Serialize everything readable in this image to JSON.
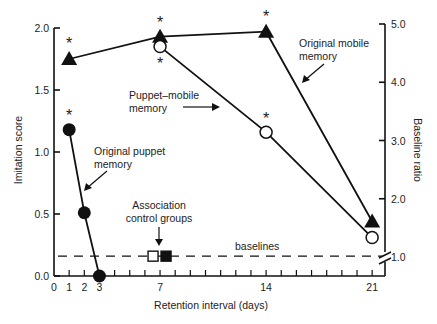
{
  "chart_data": {
    "type": "line",
    "title": "",
    "xlabel": "Retention interval (days)",
    "ylabel": "Imitation score",
    "y2label": "Baseline ratio",
    "xlim": [
      0,
      21
    ],
    "ylim": [
      0,
      2.0
    ],
    "y2lim": [
      1.0,
      5.0
    ],
    "x_ticks": [
      0,
      1,
      2,
      3,
      7,
      14,
      21
    ],
    "y_ticks": [
      "0.0",
      "0.5",
      "1.0",
      "1.5",
      "2.0"
    ],
    "y2_ticks": [
      "1.0",
      "2.0",
      "3.0",
      "4.0",
      "5.0"
    ],
    "grid": false,
    "series": [
      {
        "name": "Original mobile memory",
        "marker": "filled-triangle",
        "x": [
          1,
          7,
          14,
          21
        ],
        "values": [
          1.75,
          1.93,
          1.97,
          0.44
        ],
        "significant": [
          true,
          true,
          true,
          false
        ]
      },
      {
        "name": "Puppet–mobile memory",
        "marker": "open-circle",
        "x": [
          7,
          14,
          21
        ],
        "values": [
          1.85,
          1.16,
          0.31
        ],
        "significant": [
          true,
          true,
          false
        ]
      },
      {
        "name": "Original puppet memory",
        "marker": "filled-circle",
        "x": [
          1,
          2,
          3
        ],
        "values": [
          1.18,
          0.51,
          0.0
        ],
        "significant": [
          true,
          false,
          false
        ]
      },
      {
        "name": "Association control groups",
        "marker": "squares-open-filled",
        "x": [
          7
        ],
        "values": [
          0.16
        ]
      }
    ],
    "baseline": {
      "label": "baselines",
      "value": 0.16,
      "style": "dashed"
    },
    "annotations": [
      "Original mobile memory",
      "Puppet–mobile memory",
      "Original puppet memory",
      "Association control groups",
      "baselines"
    ]
  },
  "labels": {
    "mobile_1": "Original mobile",
    "mobile_2": "memory",
    "puppetmobile_1": "Puppet–mobile",
    "puppetmobile_2": "memory",
    "puppet_1": "Original puppet",
    "puppet_2": "memory",
    "assoc_1": "Association",
    "assoc_2": "control groups",
    "baselines": "baselines",
    "star": "*"
  }
}
